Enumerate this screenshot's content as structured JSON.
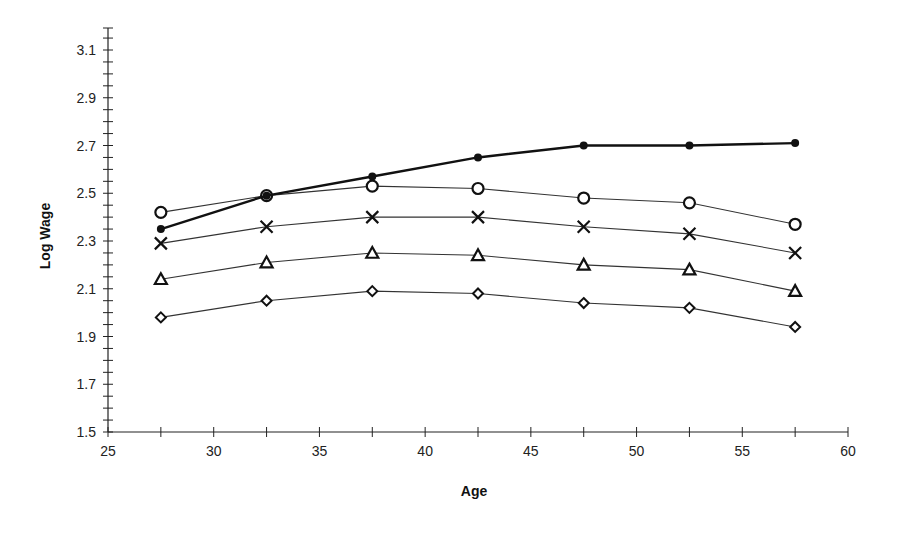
{
  "chart_data": {
    "type": "line",
    "title": "",
    "xlabel": "Age",
    "ylabel": "Log Wage",
    "xlim": [
      25,
      60
    ],
    "ylim": [
      1.5,
      3.15
    ],
    "x_ticks": [
      25,
      30,
      35,
      40,
      45,
      50,
      55,
      60
    ],
    "x_minor_step": 2.5,
    "y_ticks": [
      1.5,
      1.7,
      1.9,
      2.1,
      2.3,
      2.5,
      2.7,
      2.9,
      3.1
    ],
    "y_tick_labels": [
      "1.5",
      "1.7",
      "1.9",
      "2.1",
      "2.3",
      "2.5",
      "2.7",
      "2.9",
      "3.1"
    ],
    "y_minor_step": 0.05,
    "grid": false,
    "legend": null,
    "x": [
      27.5,
      32.5,
      37.5,
      42.5,
      47.5,
      52.5,
      57.5
    ],
    "series": [
      {
        "name": "filled-circle",
        "marker": "filled-circle",
        "line": "bold",
        "values": [
          2.35,
          2.49,
          2.57,
          2.65,
          2.7,
          2.7,
          2.71
        ]
      },
      {
        "name": "open-circle",
        "marker": "open-circle",
        "line": "thin",
        "values": [
          2.42,
          2.49,
          2.53,
          2.52,
          2.48,
          2.46,
          2.37
        ]
      },
      {
        "name": "cross",
        "marker": "x",
        "line": "thin",
        "values": [
          2.29,
          2.36,
          2.4,
          2.4,
          2.36,
          2.33,
          2.25
        ]
      },
      {
        "name": "triangle",
        "marker": "open-triangle",
        "line": "thin",
        "values": [
          2.14,
          2.21,
          2.25,
          2.24,
          2.2,
          2.18,
          2.09
        ]
      },
      {
        "name": "diamond",
        "marker": "open-diamond",
        "line": "thin",
        "values": [
          1.98,
          2.05,
          2.09,
          2.08,
          2.04,
          2.02,
          1.94
        ]
      }
    ]
  },
  "labels": {
    "xlabel": "Age",
    "ylabel": "Log Wage"
  }
}
